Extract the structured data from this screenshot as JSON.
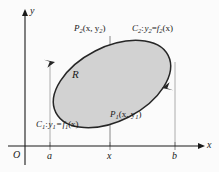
{
  "figure": {
    "kind": "math-diagram",
    "background_color": "#fbfbfb",
    "ink_color": "#1a1a1a",
    "region_fill_color": "#d2d2d2",
    "region_stroke_color": "#1a1a1a",
    "guide_line_color": "#909090"
  },
  "axes": {
    "x_label": "x",
    "y_label": "y",
    "origin_label": "O",
    "x_axis_y_px": 146,
    "y_axis_x_px": 25,
    "ticks": [
      {
        "label": "a",
        "x_px": 50
      },
      {
        "label": "x",
        "x_px": 110
      },
      {
        "label": "b",
        "x_px": 175
      }
    ]
  },
  "region": {
    "label": "R",
    "center_x_px": 112,
    "center_y_px": 84,
    "radius_x_px": 63,
    "radius_y_px": 37,
    "rotation_deg": -27
  },
  "points": [
    {
      "name": "P2",
      "text_main": "P",
      "text_sub": "2",
      "text_args": "(x, y",
      "text_args_sub": "2",
      "text_close": ")",
      "full": "P2(x, y2)",
      "x_px": 74,
      "y_px": 24
    },
    {
      "name": "P1",
      "text_main": "P",
      "text_sub": "1",
      "text_args": "(x, y",
      "text_args_sub": "1",
      "text_close": ")",
      "full": "P1(x, y1)",
      "x_px": 110,
      "y_px": 110
    }
  ],
  "curves": [
    {
      "name": "C1",
      "full": "C1 : y1 = f1(x)",
      "curve_letter": "C",
      "curve_sub": "1",
      "colon": ":",
      "y_letter": "y",
      "y_sub": "1",
      "equals": "=",
      "f_letter": "f",
      "f_sub": "1",
      "arg": "(x)",
      "x_px": 36,
      "y_px": 120
    },
    {
      "name": "C2",
      "full": "C2 : y2 = f2(x)",
      "curve_letter": "C",
      "curve_sub": "2",
      "colon": ":",
      "y_letter": "y",
      "y_sub": "2",
      "equals": "=",
      "f_letter": "f",
      "f_sub": "2",
      "arg": "(x)",
      "x_px": 132,
      "y_px": 24
    }
  ],
  "orientation": {
    "direction": "counterclockwise",
    "arrow_upper_left": "arrow pointing down-left along C2 side",
    "arrow_lower_right": "arrow pointing up-right along C1 side"
  }
}
